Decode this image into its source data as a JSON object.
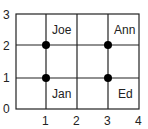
{
  "diagram": {
    "x_ticks": [
      "1",
      "2",
      "3",
      "4"
    ],
    "y_ticks": [
      "0",
      "1",
      "2",
      "3"
    ],
    "points": [
      {
        "label": "Joe",
        "x": 1,
        "y": 2
      },
      {
        "label": "Ann",
        "x": 3,
        "y": 2
      },
      {
        "label": "Jan",
        "x": 1,
        "y": 1
      },
      {
        "label": "Ed",
        "x": 3,
        "y": 1
      }
    ],
    "labels": {
      "joe": "Joe",
      "ann": "Ann",
      "jan": "Jan",
      "ed": "Ed"
    },
    "colors": {
      "grid": "#222222",
      "point": "#000000"
    }
  }
}
